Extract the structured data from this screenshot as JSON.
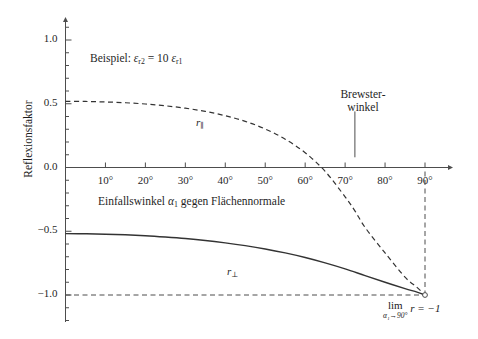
{
  "chart_data": {
    "type": "line",
    "title": "",
    "xlabel": "Einfallswinkel α₁ gegen Flächennormale",
    "ylabel": "Reflexionsfaktor",
    "xlim": [
      0,
      95
    ],
    "ylim": [
      -1.25,
      1.15
    ],
    "grid": false,
    "legend_position": "inline-curve-labels",
    "x_tick_labels": [
      "10°",
      "20°",
      "30°",
      "40°",
      "50°",
      "60°",
      "70°",
      "80°",
      "90°"
    ],
    "x_tick_values": [
      10,
      20,
      30,
      40,
      50,
      60,
      70,
      80,
      90
    ],
    "y_tick_labels": [
      "1.0",
      "0.5",
      "0.0",
      "−0.5",
      "−1.0"
    ],
    "y_tick_values": [
      1.0,
      0.5,
      0.0,
      -0.5,
      -1.0
    ],
    "y_minor_step": 0.1,
    "series": [
      {
        "name": "r∥",
        "label": "r",
        "label_sub": "∥",
        "style": "dashed",
        "color": "#333333",
        "x": [
          0,
          5,
          10,
          15,
          20,
          25,
          30,
          35,
          40,
          45,
          50,
          55,
          60,
          65,
          70,
          72.45,
          75,
          80,
          85,
          88,
          90
        ],
        "values": [
          0.519,
          0.518,
          0.514,
          0.508,
          0.498,
          0.484,
          0.465,
          0.44,
          0.406,
          0.362,
          0.302,
          0.222,
          0.116,
          -0.03,
          -0.23,
          -0.34,
          -0.47,
          -0.67,
          -0.86,
          -0.94,
          -1.0
        ]
      },
      {
        "name": "r⊥",
        "label": "r",
        "label_sub": "⊥",
        "style": "solid",
        "color": "#333333",
        "x": [
          0,
          5,
          10,
          15,
          20,
          25,
          30,
          35,
          40,
          45,
          50,
          55,
          60,
          65,
          70,
          75,
          80,
          85,
          88,
          90
        ],
        "values": [
          -0.519,
          -0.52,
          -0.523,
          -0.528,
          -0.535,
          -0.545,
          -0.557,
          -0.572,
          -0.591,
          -0.613,
          -0.639,
          -0.67,
          -0.706,
          -0.748,
          -0.795,
          -0.848,
          -0.9,
          -0.95,
          -0.978,
          -1.0
        ]
      }
    ],
    "reference_lines": [
      {
        "name": "r-equals-minus-one",
        "orientation": "horizontal",
        "value": -1.0,
        "style": "dashed"
      },
      {
        "name": "ninety-degrees",
        "orientation": "vertical",
        "value": 90,
        "style": "dashed"
      }
    ],
    "annotations": [
      {
        "name": "example-note",
        "text_prefix": "Beispiel:",
        "eps2": "ε",
        "eps2_sub": "r2",
        "equals": "=",
        "factor": "10",
        "eps1": "ε",
        "eps1_sub": "r1",
        "x": 22,
        "y": 0.78
      },
      {
        "name": "brewster-angle",
        "line1": "Brewster-",
        "line2": "winkel",
        "pointer_x": 72.45,
        "pointer_from_y": 0.44,
        "pointer_to_y": 0.08
      },
      {
        "name": "limit-note",
        "lim": "lim",
        "lim_sub": "α₁→90°",
        "expr": "r = −1",
        "x": 90,
        "y": -1.12
      }
    ]
  },
  "colors": {
    "axis": "#4d4d4d",
    "curve": "#333333",
    "text": "#1f1f1f",
    "background": "#ffffff"
  }
}
